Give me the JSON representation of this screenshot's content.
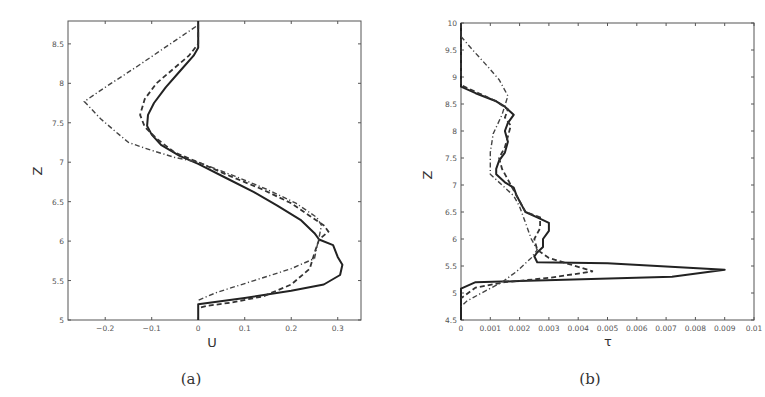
{
  "chart_data": [
    {
      "type": "line",
      "panel": "a",
      "caption": "(a)",
      "xlabel": "U",
      "ylabel": "Z",
      "xlim": [
        -0.28,
        0.35
      ],
      "ylim": [
        5,
        8.79
      ],
      "xticks": [
        -0.2,
        -0.1,
        0,
        0.1,
        0.2,
        0.3
      ],
      "xtick_labels": [
        "-0.2",
        "-0.1",
        "0",
        "0.1",
        "0.2",
        "0.3"
      ],
      "yticks": [
        5,
        5.5,
        6,
        6.5,
        7,
        7.5,
        8,
        8.5
      ],
      "ytick_labels": [
        "5",
        "5.5",
        "6",
        "6.5",
        "7",
        "7.5",
        "8",
        "8.5"
      ],
      "grid": false,
      "legend": null,
      "series": [
        {
          "name": "solid",
          "style": "solid",
          "points": [
            [
              0,
              8.79
            ],
            [
              0,
              8.45
            ],
            [
              -0.01,
              8.35
            ],
            [
              -0.04,
              8.15
            ],
            [
              -0.07,
              7.95
            ],
            [
              -0.095,
              7.75
            ],
            [
              -0.108,
              7.6
            ],
            [
              -0.11,
              7.46
            ],
            [
              -0.1,
              7.35
            ],
            [
              -0.08,
              7.22
            ],
            [
              -0.04,
              7.08
            ],
            [
              0.0,
              6.98
            ],
            [
              0.06,
              6.8
            ],
            [
              0.12,
              6.62
            ],
            [
              0.17,
              6.45
            ],
            [
              0.22,
              6.27
            ],
            [
              0.25,
              6.1
            ],
            [
              0.26,
              6.02
            ],
            [
              0.29,
              5.95
            ],
            [
              0.3,
              5.8
            ],
            [
              0.31,
              5.7
            ],
            [
              0.305,
              5.57
            ],
            [
              0.27,
              5.45
            ],
            [
              0.2,
              5.37
            ],
            [
              0.1,
              5.28
            ],
            [
              0.0,
              5.2
            ],
            [
              0,
              5
            ]
          ]
        },
        {
          "name": "dashed",
          "style": "dashed",
          "points": [
            [
              0,
              8.75
            ],
            [
              0,
              8.5
            ],
            [
              -0.02,
              8.35
            ],
            [
              -0.05,
              8.2
            ],
            [
              -0.09,
              8.0
            ],
            [
              -0.115,
              7.8
            ],
            [
              -0.125,
              7.6
            ],
            [
              -0.115,
              7.45
            ],
            [
              -0.09,
              7.3
            ],
            [
              -0.05,
              7.12
            ],
            [
              0.0,
              7.0
            ],
            [
              0.07,
              6.82
            ],
            [
              0.14,
              6.65
            ],
            [
              0.2,
              6.48
            ],
            [
              0.24,
              6.32
            ],
            [
              0.27,
              6.2
            ],
            [
              0.28,
              6.12
            ],
            [
              0.26,
              6.02
            ],
            [
              0.25,
              5.85
            ],
            [
              0.24,
              5.65
            ],
            [
              0.2,
              5.45
            ],
            [
              0.14,
              5.3
            ],
            [
              0.07,
              5.22
            ],
            [
              0.02,
              5.18
            ],
            [
              0,
              5.15
            ]
          ]
        },
        {
          "name": "dash-dot",
          "style": "dash-dot",
          "points": [
            [
              -0.005,
              8.72
            ],
            [
              -0.06,
              8.5
            ],
            [
              -0.13,
              8.22
            ],
            [
              -0.2,
              7.95
            ],
            [
              -0.245,
              7.77
            ],
            [
              -0.21,
              7.55
            ],
            [
              -0.18,
              7.4
            ],
            [
              -0.15,
              7.25
            ],
            [
              -0.1,
              7.15
            ],
            [
              -0.05,
              7.06
            ],
            [
              0.0,
              7.0
            ],
            [
              0.08,
              6.82
            ],
            [
              0.15,
              6.65
            ],
            [
              0.21,
              6.48
            ],
            [
              0.255,
              6.3
            ],
            [
              0.265,
              6.2
            ],
            [
              0.26,
              6.05
            ],
            [
              0.255,
              5.92
            ],
            [
              0.25,
              5.78
            ],
            [
              0.2,
              5.65
            ],
            [
              0.12,
              5.5
            ],
            [
              0.04,
              5.35
            ],
            [
              0,
              5.25
            ]
          ]
        }
      ]
    },
    {
      "type": "line",
      "panel": "b",
      "caption": "(b)",
      "xlabel": "τ",
      "ylabel": "Z",
      "xlim": [
        0,
        0.01
      ],
      "ylim": [
        4.5,
        10
      ],
      "xticks": [
        0,
        0.001,
        0.002,
        0.003,
        0.004,
        0.005,
        0.006,
        0.007,
        0.008,
        0.009,
        0.01
      ],
      "xtick_labels": [
        "0",
        "0.001",
        "0.002",
        "0.003",
        "0.004",
        "0.005",
        "0.006",
        "0.007",
        "0.008",
        "0.009",
        "0.01"
      ],
      "yticks": [
        4.5,
        5,
        5.5,
        6,
        6.5,
        7,
        7.5,
        8,
        8.5,
        9,
        9.5,
        10
      ],
      "ytick_labels": [
        "4.5",
        "5",
        "5.5",
        "6",
        "6.5",
        "7",
        "7.5",
        "8",
        "8.5",
        "9",
        "9.5",
        "10"
      ],
      "grid": false,
      "legend": null,
      "series": [
        {
          "name": "solid",
          "style": "solid",
          "points": [
            [
              0,
              10
            ],
            [
              0,
              8.82
            ],
            [
              0.0005,
              8.7
            ],
            [
              0.0012,
              8.55
            ],
            [
              0.0015,
              8.45
            ],
            [
              0.0018,
              8.3
            ],
            [
              0.0016,
              8.15
            ],
            [
              0.0015,
              8.0
            ],
            [
              0.0016,
              7.8
            ],
            [
              0.0015,
              7.6
            ],
            [
              0.0013,
              7.45
            ],
            [
              0.0012,
              7.3
            ],
            [
              0.0012,
              7.2
            ],
            [
              0.0015,
              7.05
            ],
            [
              0.0018,
              6.95
            ],
            [
              0.0019,
              6.8
            ],
            [
              0.0021,
              6.6
            ],
            [
              0.0022,
              6.5
            ],
            [
              0.0026,
              6.4
            ],
            [
              0.003,
              6.3
            ],
            [
              0.003,
              6.15
            ],
            [
              0.0028,
              6.0
            ],
            [
              0.0028,
              5.85
            ],
            [
              0.0026,
              5.75
            ],
            [
              0.0025,
              5.68
            ],
            [
              0.0026,
              5.57
            ],
            [
              0.005,
              5.55
            ],
            [
              0.009,
              5.43
            ],
            [
              0.0072,
              5.3
            ],
            [
              0.002,
              5.22
            ],
            [
              0.0005,
              5.2
            ],
            [
              0,
              5.08
            ],
            [
              0,
              4.5
            ]
          ]
        },
        {
          "name": "dashed",
          "style": "dashed",
          "points": [
            [
              0,
              10
            ],
            [
              0,
              8.85
            ],
            [
              0.0006,
              8.7
            ],
            [
              0.0012,
              8.55
            ],
            [
              0.0016,
              8.4
            ],
            [
              0.0015,
              8.25
            ],
            [
              0.0017,
              8.1
            ],
            [
              0.0016,
              7.9
            ],
            [
              0.0015,
              7.7
            ],
            [
              0.0013,
              7.5
            ],
            [
              0.0014,
              7.3
            ],
            [
              0.0016,
              7.1
            ],
            [
              0.0018,
              6.9
            ],
            [
              0.002,
              6.7
            ],
            [
              0.0022,
              6.5
            ],
            [
              0.0027,
              6.4
            ],
            [
              0.0027,
              6.2
            ],
            [
              0.0025,
              6.0
            ],
            [
              0.0026,
              5.8
            ],
            [
              0.003,
              5.65
            ],
            [
              0.0045,
              5.4
            ],
            [
              0.003,
              5.28
            ],
            [
              0.0015,
              5.2
            ],
            [
              0.0005,
              5.1
            ],
            [
              0,
              4.9
            ]
          ]
        },
        {
          "name": "dash-dot",
          "style": "dash-dot",
          "points": [
            [
              0,
              9.75
            ],
            [
              0.0004,
              9.5
            ],
            [
              0.0009,
              9.2
            ],
            [
              0.0013,
              8.95
            ],
            [
              0.0016,
              8.65
            ],
            [
              0.0014,
              8.3
            ],
            [
              0.0011,
              7.95
            ],
            [
              0.001,
              7.6
            ],
            [
              0.001,
              7.2
            ],
            [
              0.0014,
              7.0
            ],
            [
              0.0018,
              6.8
            ],
            [
              0.002,
              6.6
            ],
            [
              0.0022,
              6.3
            ],
            [
              0.0024,
              6.0
            ],
            [
              0.0026,
              5.8
            ],
            [
              0.0024,
              5.65
            ],
            [
              0.0019,
              5.4
            ],
            [
              0.0014,
              5.2
            ],
            [
              0.0007,
              5.0
            ],
            [
              0.0002,
              4.85
            ],
            [
              0,
              4.75
            ]
          ]
        }
      ]
    }
  ],
  "panels": [
    {
      "caption": "(a)",
      "xlabel": "U",
      "ylabel": "Z"
    },
    {
      "caption": "(b)",
      "xlabel": "τ",
      "ylabel": "Z"
    }
  ]
}
